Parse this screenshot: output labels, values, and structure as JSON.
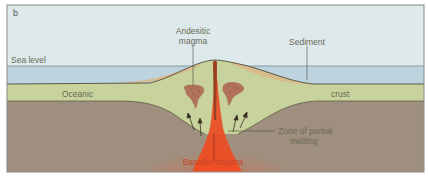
{
  "figure": {
    "panel_label": "b",
    "labels": {
      "sea_level": "Sea level",
      "andesitic_line1": "Andesitic",
      "andesitic_line2": "magma",
      "sediment": "Sediment",
      "oceanic": "Oceanic",
      "crust": "crust",
      "zone_line1": "Zone of partial",
      "zone_line2": "melting",
      "basaltic": "Basaltic magma"
    },
    "colors": {
      "sky": "#dde9eb",
      "sea": "#bdd3de",
      "crust": "#c8d29c",
      "sediment": "#d9b98a",
      "mantle": "#9f8f7e",
      "magma": "#e8492a",
      "andesite_blob": "#b0735a",
      "frame": "#8a8a8a"
    }
  }
}
